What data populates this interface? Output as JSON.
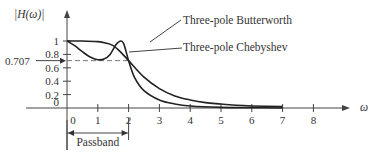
{
  "chart_data": {
    "type": "line",
    "title": "",
    "xlabel": "ω",
    "ylabel": "|H(ω)|",
    "xlim": [
      0,
      9
    ],
    "ylim": [
      0,
      1.1
    ],
    "x_ticks": [
      "0",
      "1",
      "2",
      "3",
      "4",
      "5",
      "6",
      "7",
      "8"
    ],
    "y_ticks": [
      "0",
      "0.2",
      "0.4",
      "0.6",
      "0.8",
      "1"
    ],
    "reference_line": {
      "y": 0.707,
      "label": "0.707",
      "style": "dashed"
    },
    "annotation_passband": {
      "label": "Passband",
      "from": 0,
      "to": 2
    },
    "series": [
      {
        "name": "Three-pole Butterworth",
        "x": [
          0,
          0.5,
          1,
          1.25,
          1.5,
          1.75,
          2,
          2.5,
          3,
          3.5,
          4,
          4.5,
          5,
          5.5,
          6,
          7
        ],
        "values": [
          1,
          1,
          0.99,
          0.97,
          0.93,
          0.83,
          0.707,
          0.46,
          0.29,
          0.18,
          0.12,
          0.08,
          0.06,
          0.04,
          0.03,
          0.02
        ]
      },
      {
        "name": "Three-pole Chebyshev",
        "x": [
          0,
          0.25,
          0.5,
          0.75,
          1,
          1.2,
          1.4,
          1.6,
          1.75,
          1.85,
          2,
          2.2,
          2.5,
          3,
          3.5,
          4,
          5,
          6,
          7
        ],
        "values": [
          1,
          0.93,
          0.84,
          0.76,
          0.72,
          0.73,
          0.8,
          0.95,
          1.0,
          0.95,
          0.707,
          0.45,
          0.26,
          0.12,
          0.06,
          0.03,
          0.01,
          0.005,
          0.0
        ]
      }
    ],
    "legend": [
      {
        "label": "Three-pole Butterworth",
        "placement": "top-center"
      },
      {
        "label": "Three-pole Chebyshev",
        "placement": "top-center"
      }
    ]
  }
}
